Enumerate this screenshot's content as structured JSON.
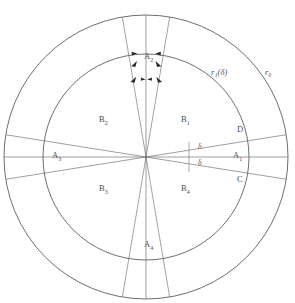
{
  "figure": {
    "type": "geometric-diagram",
    "background_color": "#ffffff",
    "line_color": "#565656",
    "center": {
      "x": 146,
      "y": 157
    },
    "outer_radius": 142,
    "inner_radius": 103
  },
  "radius_labels": {
    "inner": "r₁(δ)",
    "outer": "r₀"
  },
  "vertex_labels": {
    "a1": "A",
    "a1_sub": "1",
    "a2": "A",
    "a2_sub": "2",
    "a3": "A",
    "a3_sub": "3",
    "a4": "A",
    "a4_sub": "4",
    "c": "C",
    "d": "D"
  },
  "region_labels": {
    "b1": "B",
    "b1_sub": "1",
    "b2": "B",
    "b2_sub": "2",
    "b3": "B",
    "b3_sub": "3",
    "b4": "B",
    "b4_sub": "4"
  },
  "angle_labels": {
    "delta_upper": "δ",
    "delta_lower": "δ"
  },
  "geometry": {
    "wedge_half_angle_deg": 9.6,
    "delta_angle_deg": 9.0,
    "arrow_count": 8,
    "arrow_direction": "inward"
  }
}
